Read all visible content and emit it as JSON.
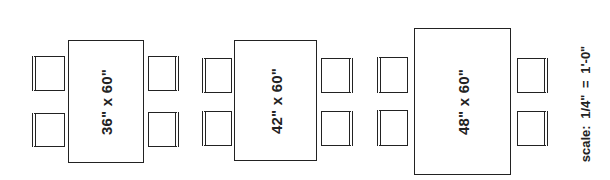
{
  "diagram": {
    "tables": [
      {
        "label": "36\" x 60\"",
        "width_in": 36,
        "length_in": 60,
        "chairs": 4
      },
      {
        "label": "42\" x 60\"",
        "width_in": 42,
        "length_in": 60,
        "chairs": 4
      },
      {
        "label": "48\" x 60\"",
        "width_in": 48,
        "length_in": 60,
        "chairs": 4
      }
    ],
    "scale_label": "scale: 1/4\"  =  1'-0\""
  },
  "colors": {
    "line": "#222222",
    "background": "#ffffff"
  }
}
